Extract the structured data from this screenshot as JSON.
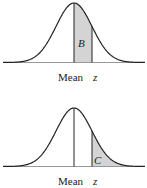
{
  "colors": {
    "curve": "#222222",
    "shade": "#d4d4d4",
    "axis": "#999999"
  },
  "panels": [
    {
      "region_label": "B",
      "mean_label": "Mean",
      "z_label": "z",
      "shaded": "mean-to-z"
    },
    {
      "region_label": "C",
      "mean_label": "Mean",
      "z_label": "z",
      "shaded": "beyond-z"
    }
  ]
}
